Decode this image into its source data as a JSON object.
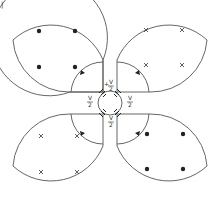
{
  "figure": {
    "corner_mark": "|",
    "line_color": "#555555",
    "marker_color": "#222222",
    "label_plus": "+",
    "label_minus": "−",
    "label_v": "V",
    "label_2": "2"
  },
  "loops": [
    {
      "id": "top-left",
      "marker": "dot"
    },
    {
      "id": "top-right",
      "marker": "cross"
    },
    {
      "id": "bottom-left",
      "marker": "cross"
    },
    {
      "id": "bottom-right",
      "marker": "dot"
    }
  ],
  "sources": [
    {
      "position": "top",
      "label": "+V/2"
    },
    {
      "position": "left",
      "label": "−V/2"
    },
    {
      "position": "right",
      "label": "−V/2"
    },
    {
      "position": "bottom",
      "label": "+V/2"
    }
  ]
}
